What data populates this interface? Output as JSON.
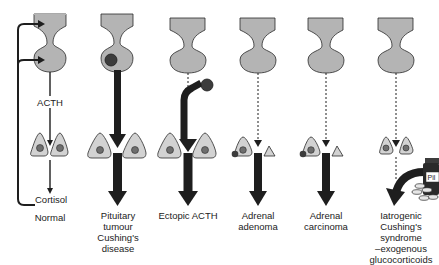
{
  "diagram": {
    "colors": {
      "gland_fill": "#b4b4b4",
      "cell_fill": "#d2d2d2",
      "nucleus_fill": "#6e6e6e",
      "arrow": "#1e1e1e",
      "outline": "#2a2a2a"
    },
    "hormone_labels": {
      "acth": "ACTH",
      "cortisol": "Cortisol"
    },
    "pill_bottle_label": "Pil",
    "columns": [
      {
        "id": "normal",
        "caption": [
          "Normal"
        ]
      },
      {
        "id": "pituitary-tumour",
        "caption": [
          "Pituitary",
          "tumour",
          "Cushing's",
          "disease"
        ]
      },
      {
        "id": "ectopic-acth",
        "caption": [
          "Ectopic ACTH"
        ]
      },
      {
        "id": "adrenal-adenoma",
        "caption": [
          "Adrenal",
          "adenoma"
        ]
      },
      {
        "id": "adrenal-carcinoma",
        "caption": [
          "Adrenal",
          "carcinoma"
        ]
      },
      {
        "id": "iatrogenic",
        "caption": [
          "Iatrogenic",
          "Cushing's",
          "syndrome",
          "–exogenous",
          "glucocorticoids"
        ]
      }
    ]
  }
}
